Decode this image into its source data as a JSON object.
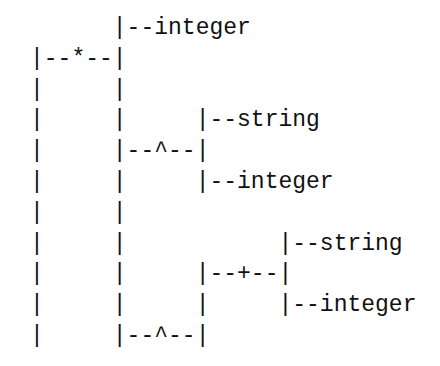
{
  "diagram": {
    "type": "ascii-type-tree",
    "lines": [
      "      |--integer",
      "|--*--|",
      "|     |",
      "|     |     |--string",
      "|     |--^--|",
      "|     |     |--integer",
      "|     |",
      "|     |           |--string",
      "|     |     |--+--|",
      "|     |     |     |--integer",
      "|     |--^--|"
    ],
    "nodes": {
      "root": {
        "operator": "*",
        "children": [
          "integer",
          "^"
        ]
      },
      "first_caret": {
        "operator": "^",
        "children": [
          "string",
          "integer"
        ]
      },
      "second_caret": {
        "operator": "^",
        "children": [
          "+"
        ]
      },
      "plus": {
        "operator": "+",
        "children": [
          "string",
          "integer"
        ]
      }
    }
  }
}
